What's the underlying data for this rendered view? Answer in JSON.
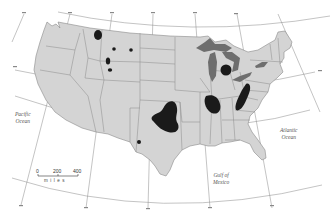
{
  "map": {
    "subject": "Contiguous United States with highlighted regions",
    "labels": {
      "pacific": "Pacific Ocean",
      "pacific_line1": "Pacific",
      "pacific_line2": "Ocean",
      "atlantic_line1": "Atlantic",
      "atlantic_line2": "Ocean",
      "gulf_line1": "Gulf of",
      "gulf_line2": "Mexico"
    },
    "scale": {
      "ticks": [
        "0",
        "200",
        "400"
      ],
      "units": "miles"
    },
    "colors": {
      "land": "#d4d4d4",
      "borders": "#8a8a8a",
      "lakes": "#6e6e6e",
      "highlight": "#1a1a1a",
      "water": "#ffffff",
      "graticule": "#777777"
    },
    "highlighted_regions": [
      "northwestern Montana",
      "central Montana (2 spots)",
      "north-central Wyoming (2 spots)",
      "Kansas / Oklahoma (large)",
      "northern Texas panhandle (small)",
      "central Michigan (round)",
      "Illinois basin",
      "Ohio / West Virginia (Appalachian)"
    ]
  }
}
